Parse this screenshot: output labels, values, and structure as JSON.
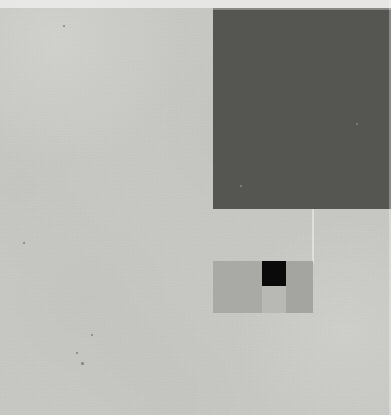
{
  "composition": {
    "title": "Abstract Geometric Composition",
    "canvas": {
      "width": 391,
      "height": 415
    },
    "background_color": "#cacac6",
    "texture": "paper-grain"
  },
  "palette": {
    "background": "#cacac6",
    "dark_block": "#555552",
    "panel_left": "#a9a9a5",
    "panel_right": "#a4a4a0",
    "panel_bottom": "#b8b8b4",
    "black_square": "#0a0a0a",
    "seam_light": "#ffffff"
  },
  "shapes": [
    {
      "name": "dark-block",
      "label": "Large dark square, top-right",
      "color": "#555552",
      "x": 213,
      "y": 8,
      "width": 178,
      "height": 201
    },
    {
      "name": "panel-left",
      "label": "Left gray panel of cluster",
      "color": "#a9a9a5",
      "x": 213,
      "y": 261,
      "width": 49,
      "height": 52
    },
    {
      "name": "black-square",
      "label": "Small black square",
      "color": "#0a0a0a",
      "x": 262,
      "y": 261,
      "width": 24,
      "height": 25
    },
    {
      "name": "panel-bottom",
      "label": "Light panel beneath black square",
      "color": "#b8b8b4",
      "x": 262,
      "y": 286,
      "width": 24,
      "height": 27
    },
    {
      "name": "panel-right",
      "label": "Right gray panel of cluster",
      "color": "#a4a4a0",
      "x": 286,
      "y": 261,
      "width": 27,
      "height": 52
    }
  ],
  "seams": [
    {
      "name": "seam-vertical-connector",
      "label": "Faint vertical light seam from dark block down to cluster",
      "x": 312,
      "y": 209,
      "width": 2,
      "height": 54
    },
    {
      "name": "seam-top-edge",
      "label": "Light strip along top edge of canvas",
      "x": 0,
      "y": 0,
      "width": 391,
      "height": 8
    },
    {
      "name": "seam-right-edge",
      "label": "Light strip along right edge of canvas",
      "x": 389,
      "y": 0,
      "width": 2,
      "height": 415
    }
  ],
  "specks": [
    {
      "name": "speck-a",
      "x": 63,
      "y": 25,
      "size": 2
    },
    {
      "name": "speck-b",
      "x": 23,
      "y": 242,
      "size": 2
    },
    {
      "name": "speck-c",
      "x": 91,
      "y": 334,
      "size": 2
    },
    {
      "name": "speck-d",
      "x": 76,
      "y": 352,
      "size": 2
    },
    {
      "name": "speck-e",
      "x": 81,
      "y": 362,
      "size": 3
    },
    {
      "name": "speck-f",
      "x": 240,
      "y": 185,
      "size": 2
    },
    {
      "name": "speck-g",
      "x": 356,
      "y": 123,
      "size": 2
    }
  ]
}
